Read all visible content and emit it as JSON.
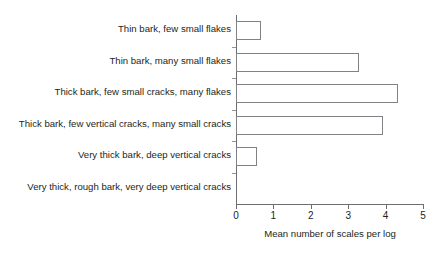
{
  "chart_data": {
    "type": "bar",
    "orientation": "horizontal",
    "title": "",
    "xlabel": "Mean number of scales per log",
    "ylabel": "",
    "xlim": [
      0,
      5
    ],
    "xticks": [
      "0",
      "1",
      "2",
      "3",
      "4",
      "5"
    ],
    "grid": false,
    "legend": null,
    "categories": [
      "Thin bark, few small flakes",
      "Thin bark, many small flakes",
      "Thick bark, few small cracks, many flakes",
      "Thick bark, few vertical cracks, many small cracks",
      "Very thick bark, deep vertical cracks",
      "Very thick, rough bark, very deep vertical cracks"
    ],
    "values": [
      0.67,
      3.3,
      4.33,
      3.93,
      0.56,
      0
    ],
    "bar_fill_color": "#ffffff",
    "bar_edge_color": "#808285",
    "axis_color": "#6d6e70",
    "text_color": "#231f20",
    "background_color": "#ffffff"
  }
}
